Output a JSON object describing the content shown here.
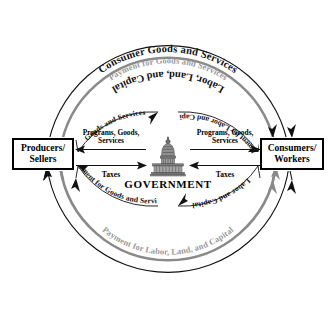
{
  "diagram": {
    "background_color": "#ffffff",
    "accent_gray": "#8a8a8a",
    "accent_black": "#111111"
  },
  "entities": {
    "producers": {
      "line1": "Producers/",
      "line2": "Sellers"
    },
    "consumers": {
      "line1": "Consumers/",
      "line2": "Workers"
    },
    "government": {
      "label": "GOVERNMENT",
      "icon": "capitol-building-icon"
    }
  },
  "outer_arcs": {
    "top_outer": {
      "label": "Consumer Goods and Services",
      "color": "#111111",
      "direction": "left-to-right"
    },
    "top_inner": {
      "label": "Payment for Goods and Services",
      "color": "#8a8a8a",
      "direction": "right-to-left"
    },
    "bottom_outer": {
      "label": "Labor, Land, and Capital",
      "color": "#111111",
      "direction": "right-to-left"
    },
    "bottom_inner": {
      "label": "Payment for Labor, Land, and Capital",
      "color": "#8a8a8a",
      "direction": "left-to-right"
    }
  },
  "inner_arcs": {
    "top_left": {
      "label": "Goods and Services",
      "direction": "toward-government"
    },
    "top_right": {
      "label": "Payment for Labor and Capital",
      "direction": "toward-consumers"
    },
    "bottom_left": {
      "label": "Payment for Goods and Services",
      "direction": "toward-producers"
    },
    "bottom_right": {
      "label": "Labor and Capital",
      "direction": "toward-government"
    }
  },
  "center_flows": {
    "left": {
      "outbound_label_line1": "Programs, Goods,",
      "outbound_label_line2": "Services",
      "outbound_direction": "left",
      "inbound_label": "Taxes",
      "inbound_direction": "right"
    },
    "right": {
      "outbound_label_line1": "Programs, Goods,",
      "outbound_label_line2": "Services",
      "outbound_direction": "right",
      "inbound_label": "Taxes",
      "inbound_direction": "left"
    }
  }
}
